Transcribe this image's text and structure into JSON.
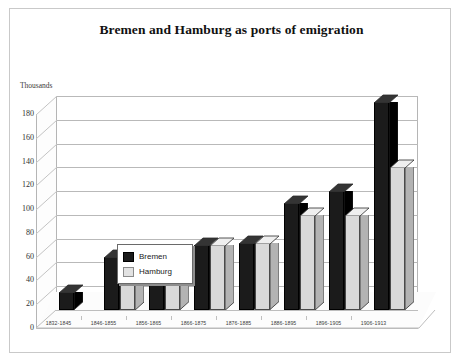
{
  "page": {
    "title": "Bremen and Hamburg as ports of emigration",
    "axis_unit_label": "Thousands"
  },
  "legend": {
    "position": "inside-top-left",
    "items": [
      {
        "label": "Bremen",
        "color": "#1b1b1b"
      },
      {
        "label": "Hamburg",
        "color": "#d9d9d9"
      }
    ]
  },
  "chart_data": {
    "type": "bar",
    "title": "Bremen and Hamburg as ports of emigration",
    "subtitle": "",
    "xlabel": "",
    "ylabel": "Thousands",
    "ylim": [
      0,
      180
    ],
    "yticks": [
      0,
      20,
      40,
      60,
      80,
      100,
      120,
      140,
      160,
      180
    ],
    "ytick_labels": [
      "0",
      "20",
      "40",
      "60",
      "80",
      "100",
      "120",
      "140",
      "160",
      "180"
    ],
    "grid": true,
    "style": "3d-clustered-column",
    "legend_entries": [
      "Bremen",
      "Hamburg"
    ],
    "categories": [
      "1832-1845",
      "1846-1855",
      "1856-1865",
      "1866-1875",
      "1876-1885",
      "1886-1895",
      "1896-1905",
      "1906-1913"
    ],
    "series": [
      {
        "name": "Bremen",
        "color": "#1b1b1b",
        "values": [
          15,
          45,
          45,
          55,
          56,
          90,
          100,
          175
        ]
      },
      {
        "name": "Hamburg",
        "color": "#d9d9d9",
        "values": [
          0,
          22,
          25,
          55,
          56,
          80,
          80,
          120
        ]
      }
    ]
  }
}
